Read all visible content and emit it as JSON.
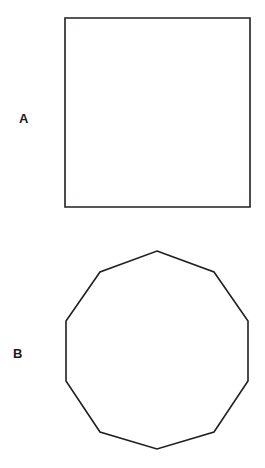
{
  "figure": {
    "background_color": "#ffffff",
    "stroke_color": "#231f20",
    "fill_color": "#ffffff",
    "stroke_width": 1.6,
    "width": 265,
    "height": 468
  },
  "panels": [
    {
      "label": "A",
      "shape_name": "square",
      "sides": 4,
      "label_position": {
        "x": 19,
        "y": 112
      },
      "bounds": {
        "x": 65,
        "y": 18,
        "width": 185,
        "height": 189
      },
      "points": "65,18 250,18 250,207 65,207"
    },
    {
      "label": "B",
      "shape_name": "decagon",
      "sides": 10,
      "label_position": {
        "x": 13,
        "y": 347
      },
      "bounds": {
        "x": 66,
        "y": 251,
        "width": 182,
        "height": 198
      },
      "points": "157,251 214,272 248,321 248,381 214,432 157,449 100,432 66,381 66,321 100,272"
    }
  ],
  "chart_data": {
    "type": "diagram",
    "title": "",
    "items": [
      {
        "label": "A",
        "shape": "square",
        "sides": 4,
        "vertices": [
          [
            65,
            18
          ],
          [
            250,
            18
          ],
          [
            250,
            207
          ],
          [
            65,
            207
          ]
        ]
      },
      {
        "label": "B",
        "shape": "decagon",
        "sides": 10,
        "vertices": [
          [
            157,
            251
          ],
          [
            214,
            272
          ],
          [
            248,
            321
          ],
          [
            248,
            381
          ],
          [
            214,
            432
          ],
          [
            157,
            449
          ],
          [
            100,
            432
          ],
          [
            66,
            381
          ],
          [
            66,
            321
          ],
          [
            100,
            272
          ]
        ]
      }
    ]
  }
}
